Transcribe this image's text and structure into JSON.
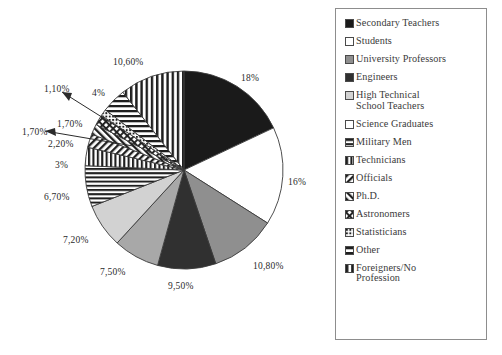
{
  "chart_data": {
    "type": "pie",
    "title": "",
    "xlabel": "",
    "ylabel": "",
    "legend_position": "right",
    "grid": false,
    "categories": [
      "Secondary Teachers",
      "Students",
      "University Professors",
      "Engineers",
      "High Technical School Teachers",
      "Science Graduates",
      "Military Men",
      "Technicians",
      "Officials",
      "Ph.D.",
      "Astronomers",
      "Statisticians",
      "Other",
      "Foreigners/No Profession"
    ],
    "values": [
      18,
      16,
      10.8,
      9.5,
      7.5,
      7.2,
      6.7,
      3,
      2.2,
      1.7,
      1.7,
      1.1,
      4,
      10.6
    ],
    "value_labels": [
      "18%",
      "16%",
      "10,80%",
      "9,50%",
      "7,50%",
      "7,20%",
      "6,70%",
      "3%",
      "2,20%",
      "1,70%",
      "1,70%",
      "1,10%",
      "4%",
      "10,60%"
    ],
    "fills": [
      "solid-black",
      "solid-white",
      "solid-medium-gray",
      "solid-dark-gray",
      "solid-gray",
      "solid-light-gray",
      "horizontal-lines",
      "vertical-lines",
      "diagonal-hatch",
      "forward-diagonal-hatch",
      "cross-hatch",
      "dense-dots",
      "horizontal-band",
      "vertical-stripes"
    ]
  },
  "slice_labels": [
    {
      "text": "18%",
      "x": 241,
      "y": 73,
      "name": "slice-label-secondary-teachers"
    },
    {
      "text": "16%",
      "x": 288,
      "y": 177,
      "name": "slice-label-students"
    },
    {
      "text": "10,80%",
      "x": 253,
      "y": 261,
      "name": "slice-label-university-professors"
    },
    {
      "text": "9,50%",
      "x": 168,
      "y": 281,
      "name": "slice-label-engineers"
    },
    {
      "text": "7,50%",
      "x": 100,
      "y": 267,
      "name": "slice-label-high-technical-school-teachers"
    },
    {
      "text": "7,20%",
      "x": 63,
      "y": 235,
      "name": "slice-label-science-graduates"
    },
    {
      "text": "6,70%",
      "x": 44,
      "y": 192,
      "name": "slice-label-military-men"
    },
    {
      "text": "3%",
      "x": 55,
      "y": 160,
      "name": "slice-label-technicians"
    },
    {
      "text": "2,20%",
      "x": 48,
      "y": 139,
      "name": "slice-label-officials"
    },
    {
      "text": "1,70%",
      "x": 57,
      "y": 119,
      "name": "slice-label-phd"
    },
    {
      "text": "1,70%",
      "x": 22,
      "y": 127,
      "name": "slice-label-astronomers"
    },
    {
      "text": "1,10%",
      "x": 44,
      "y": 84,
      "name": "slice-label-statisticians"
    },
    {
      "text": "4%",
      "x": 92,
      "y": 88,
      "name": "slice-label-other"
    },
    {
      "text": "10,60%",
      "x": 113,
      "y": 57,
      "name": "slice-label-foreigners"
    }
  ],
  "legend": {
    "items": [
      {
        "label": "Secondary Teachers",
        "fill": "solid-black"
      },
      {
        "label": "Students",
        "fill": "solid-white"
      },
      {
        "label": "University Professors",
        "fill": "solid-medium-gray"
      },
      {
        "label": "Engineers",
        "fill": "solid-dark-gray"
      },
      {
        "label": "High Technical\nSchool Teachers",
        "fill": "solid-light-gray"
      },
      {
        "label": "Science Graduates",
        "fill": "solid-white"
      },
      {
        "label": "Military Men",
        "fill": "horizontal-lines"
      },
      {
        "label": "Technicians",
        "fill": "vertical-lines"
      },
      {
        "label": "Officials",
        "fill": "diagonal-hatch"
      },
      {
        "label": "Ph.D.",
        "fill": "forward-diagonal-hatch"
      },
      {
        "label": "Astronomers",
        "fill": "cross-hatch"
      },
      {
        "label": "Statisticians",
        "fill": "dense-dots"
      },
      {
        "label": "Other",
        "fill": "horizontal-band"
      },
      {
        "label": "Foreigners/No\nProfession",
        "fill": "vertical-stripes"
      }
    ]
  },
  "colors": {
    "solid_black": "#1a1a1a",
    "solid_white": "#ffffff",
    "solid_medium_gray": "#8f8f8f",
    "solid_dark_gray": "#303030",
    "solid_gray": "#a8a8a8",
    "solid_light_gray": "#d2d2d2",
    "outline": "#3a3a3a",
    "legend_border": "#8d8d8d",
    "text": "#2b2b2b"
  },
  "geometry": {
    "center_x": 184,
    "center_y": 170,
    "radius": 99
  }
}
